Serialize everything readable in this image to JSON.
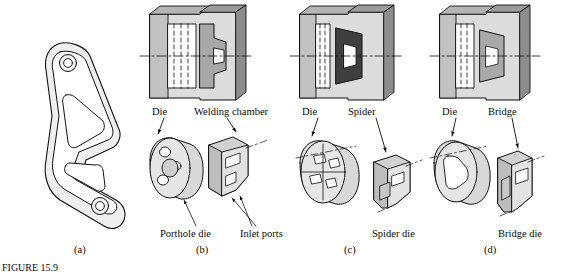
{
  "figure": {
    "panels": [
      {
        "id": "a",
        "letter": "(a)",
        "labels": []
      },
      {
        "id": "b",
        "letter": "(b)",
        "labels": [
          "Die",
          "Welding chamber",
          "Porthole die",
          "Inlet ports"
        ]
      },
      {
        "id": "c",
        "letter": "(c)",
        "labels": [
          "Die",
          "Spider",
          "Spider die"
        ]
      },
      {
        "id": "d",
        "letter": "(d)",
        "labels": [
          "Die",
          "Bridge",
          "Bridge die"
        ]
      }
    ],
    "panel_a": {
      "letter": "(a)"
    },
    "panel_b": {
      "letter": "(b)",
      "die": "Die",
      "welding_chamber": "Welding chamber",
      "porthole_die": "Porthole die",
      "inlet_ports": "Inlet ports"
    },
    "panel_c": {
      "letter": "(c)",
      "die": "Die",
      "spider": "Spider",
      "spider_die": "Spider die"
    },
    "panel_d": {
      "letter": "(d)",
      "die": "Die",
      "bridge": "Bridge",
      "bridge_die": "Bridge die"
    },
    "caption": "FIGURE 15.9",
    "colors": {
      "line": "#101010",
      "fill_light": "#e9e9e9",
      "fill_mid": "#c9c9c9",
      "fill_dark": "#9a9a9a",
      "fill_darkest": "#4a4a4a",
      "centerline": "#101010"
    }
  }
}
